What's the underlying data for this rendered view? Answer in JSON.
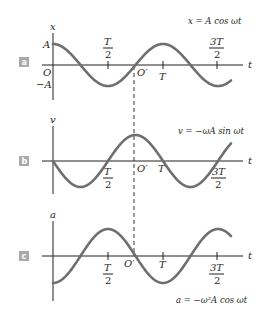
{
  "colors": {
    "curve": "#6d6e71",
    "axis": "#231f20",
    "badge": "#a7a9ac"
  },
  "panels": [
    {
      "badge": "a",
      "y_axis_label": "x",
      "x_axis_label": "t",
      "equation": "x = A cos ωt",
      "amp_label_pos": "A",
      "amp_label_neg": "−A",
      "origin_label": "O",
      "origin_prime_label": "O′",
      "ticks": {
        "half_T_num": "T",
        "half_T_den": "2",
        "T": "T",
        "three_half_T_num": "3T",
        "three_half_T_den": "2"
      }
    },
    {
      "badge": "b",
      "y_axis_label": "v",
      "x_axis_label": "t",
      "equation": "v = −ωA sin ωt",
      "origin_prime_label": "O′",
      "ticks": {
        "half_T_num": "T",
        "half_T_den": "2",
        "T": "T",
        "three_half_T_num": "3T",
        "three_half_T_den": "2"
      }
    },
    {
      "badge": "c",
      "y_axis_label": "a",
      "x_axis_label": "t",
      "equation": "a = −ω²A cos ωt",
      "origin_prime_label": "O′",
      "ticks": {
        "half_T_num": "T",
        "half_T_den": "2",
        "T": "T",
        "three_half_T_num": "3T",
        "three_half_T_den": "2"
      }
    }
  ],
  "chart_data": [
    {
      "type": "line",
      "title": "x = A cos ωt",
      "xlabel": "t",
      "ylabel": "x",
      "function": "A cos(ωt)",
      "x_ticks": [
        "T/2",
        "T",
        "3T/2"
      ],
      "y_ticks": [
        "A",
        "-A"
      ],
      "x_range_periods": [
        0,
        1.65
      ]
    },
    {
      "type": "line",
      "title": "v = −ωA sin ωt",
      "xlabel": "t",
      "ylabel": "v",
      "function": "-ωA sin(ωt)",
      "x_ticks": [
        "T/2",
        "T",
        "3T/2"
      ],
      "x_range_periods": [
        0,
        1.65
      ]
    },
    {
      "type": "line",
      "title": "a = −ω²A cos ωt",
      "xlabel": "t",
      "ylabel": "a",
      "function": "-ω²A cos(ωt)",
      "x_ticks": [
        "T/2",
        "T",
        "3T/2"
      ],
      "x_range_periods": [
        0,
        1.65
      ]
    }
  ]
}
